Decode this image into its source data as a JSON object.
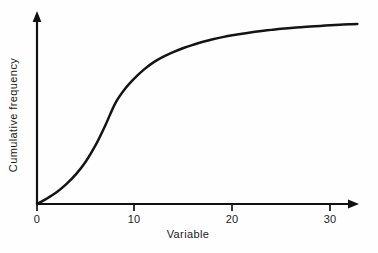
{
  "figure": {
    "background_color": "#fefefe",
    "ink_color": "#141414",
    "width": 378,
    "height": 253
  },
  "axes": {
    "x_title": "Variable",
    "y_title": "Cumulative frequency",
    "x_tick_labels": [
      "0",
      "10",
      "20",
      "30"
    ],
    "y_tick_labels": []
  },
  "chart_data": {
    "type": "line",
    "title": "",
    "subtitle": "",
    "xlabel": "Variable",
    "ylabel": "Cumulative frequency",
    "xlim": [
      0,
      32.8
    ],
    "ylim": [
      0,
      100
    ],
    "xticks": [
      0,
      10,
      20,
      30
    ],
    "xticklabels": [
      "0",
      "10",
      "20",
      "30"
    ],
    "yticks": [],
    "yticklabels": [],
    "grid": false,
    "legend": false,
    "legend_position": "none",
    "annotations": [],
    "series": [
      {
        "name": "Cumulative frequency ogive",
        "color": "#141414",
        "line_width": 2.5,
        "marker": "none",
        "x": [
          0,
          1,
          2,
          3,
          4,
          5,
          6,
          7,
          8,
          9,
          10,
          11,
          12,
          13,
          14,
          15,
          16,
          17,
          18,
          19,
          20,
          21,
          22,
          23,
          24,
          25,
          26,
          27,
          28,
          29,
          30,
          31,
          32,
          32.8
        ],
        "y": [
          0,
          3,
          6.5,
          11,
          16.5,
          23.5,
          32.5,
          43.5,
          55.5,
          63.5,
          69.5,
          74.5,
          78.5,
          81.5,
          84,
          86.2,
          88,
          89.6,
          91,
          92.2,
          93.2,
          94.1,
          94.9,
          95.6,
          96.2,
          96.8,
          97.3,
          97.7,
          98.1,
          98.4,
          98.7,
          99,
          99.3,
          99.5
        ]
      }
    ]
  }
}
